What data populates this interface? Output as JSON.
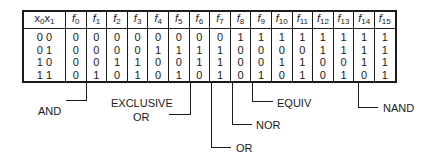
{
  "table": {
    "input_header": {
      "a": "x",
      "a_sub": "0",
      "b": "x",
      "b_sub": "1"
    },
    "function_headers": [
      {
        "f": "f",
        "sub": "0"
      },
      {
        "f": "f",
        "sub": "1"
      },
      {
        "f": "f",
        "sub": "2"
      },
      {
        "f": "f",
        "sub": "3"
      },
      {
        "f": "f",
        "sub": "4"
      },
      {
        "f": "f",
        "sub": "5"
      },
      {
        "f": "f",
        "sub": "6"
      },
      {
        "f": "f",
        "sub": "7"
      },
      {
        "f": "f",
        "sub": "8"
      },
      {
        "f": "f",
        "sub": "9"
      },
      {
        "f": "f",
        "sub": "10"
      },
      {
        "f": "f",
        "sub": "11"
      },
      {
        "f": "f",
        "sub": "12"
      },
      {
        "f": "f",
        "sub": "13"
      },
      {
        "f": "f",
        "sub": "14"
      },
      {
        "f": "f",
        "sub": "15"
      }
    ],
    "rows": [
      {
        "input": "0 0",
        "values": [
          "0",
          "0",
          "0",
          "0",
          "0",
          "0",
          "0",
          "0",
          "1",
          "1",
          "1",
          "1",
          "1",
          "1",
          "1",
          "1"
        ]
      },
      {
        "input": "0 1",
        "values": [
          "0",
          "0",
          "0",
          "0",
          "1",
          "1",
          "1",
          "1",
          "0",
          "0",
          "0",
          "0",
          "1",
          "1",
          "1",
          "1"
        ]
      },
      {
        "input": "1 0",
        "values": [
          "0",
          "0",
          "1",
          "1",
          "0",
          "0",
          "1",
          "1",
          "0",
          "0",
          "1",
          "1",
          "0",
          "0",
          "1",
          "1"
        ]
      },
      {
        "input": "1 1",
        "values": [
          "0",
          "1",
          "0",
          "1",
          "0",
          "1",
          "0",
          "1",
          "0",
          "1",
          "0",
          "1",
          "0",
          "1",
          "0",
          "1"
        ]
      }
    ]
  },
  "annotations": {
    "and": {
      "label": "AND",
      "column": "f1"
    },
    "xor": {
      "label_line1": "EXCLUSIVE",
      "label_line2": "OR",
      "column": "f6"
    },
    "or": {
      "label": "OR",
      "column": "f7"
    },
    "nor": {
      "label": "NOR",
      "column": "f8"
    },
    "equiv": {
      "label": "EQUIV",
      "column": "f9"
    },
    "nand": {
      "label": "NAND",
      "column": "f14"
    }
  }
}
